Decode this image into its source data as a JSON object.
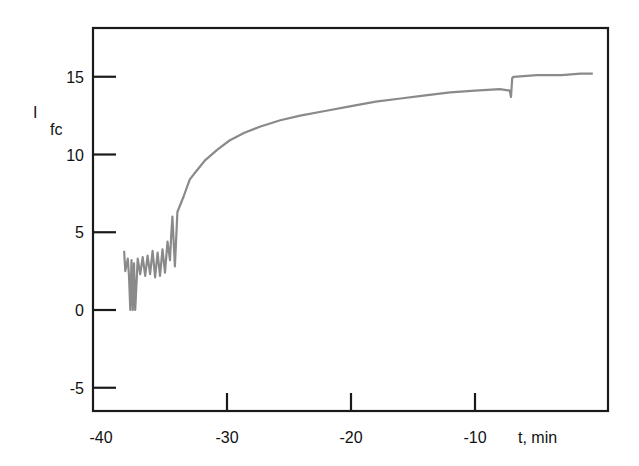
{
  "chart_data": {
    "type": "line",
    "title": "",
    "xlabel": "t, min",
    "ylabel": "I",
    "ylabel_subscript": "fc",
    "xlim": [
      -40.8,
      0.7
    ],
    "ylim": [
      -6.5,
      18.5
    ],
    "xticks": [
      -40,
      -30,
      -20,
      -10
    ],
    "xtick_labels": [
      "-40",
      "-30",
      "-20",
      "-10"
    ],
    "yticks": [
      15,
      10,
      5,
      0,
      -5
    ],
    "ytick_labels": [
      "15",
      "10",
      "5",
      "0",
      "-5"
    ],
    "grid": false,
    "legend": null,
    "series": [
      {
        "name": "I_fc",
        "color": "#8a8a8a",
        "x": [
          -38.3,
          -38.2,
          -38.0,
          -37.9,
          -37.8,
          -37.7,
          -37.6,
          -37.5,
          -37.4,
          -37.2,
          -37.0,
          -36.8,
          -36.6,
          -36.4,
          -36.2,
          -36.0,
          -35.8,
          -35.6,
          -35.4,
          -35.2,
          -35.0,
          -34.8,
          -34.6,
          -34.5,
          -34.4,
          -34.2,
          -34.0,
          -33.5,
          -33.0,
          -32.4,
          -31.8,
          -30.8,
          -29.8,
          -28.6,
          -27.3,
          -25.7,
          -24.1,
          -22.1,
          -20.1,
          -18.0,
          -16.0,
          -14.0,
          -12.0,
          -10.0,
          -8.0,
          -7.2,
          -7.1,
          -7.0,
          -6.9,
          -5.0,
          -3.0,
          -1.5,
          -0.5
        ],
        "y": [
          3.8,
          2.5,
          3.3,
          2.2,
          0.0,
          3.2,
          0.0,
          3.0,
          0.0,
          3.3,
          2.3,
          3.4,
          2.2,
          3.5,
          2.3,
          3.8,
          2.1,
          3.7,
          2.2,
          3.9,
          2.4,
          4.4,
          3.2,
          4.8,
          6.0,
          2.8,
          6.3,
          7.3,
          8.4,
          9.0,
          9.6,
          10.3,
          10.9,
          11.4,
          11.8,
          12.2,
          12.5,
          12.8,
          13.1,
          13.4,
          13.6,
          13.8,
          14.0,
          14.1,
          14.2,
          14.1,
          13.7,
          14.9,
          15.0,
          15.1,
          15.1,
          15.2,
          15.2
        ]
      }
    ]
  }
}
